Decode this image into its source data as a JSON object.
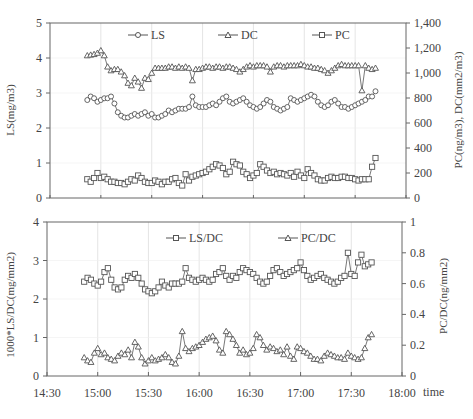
{
  "chart_data": [
    {
      "type": "line",
      "title": "",
      "x_unit": "minutes after 14:30",
      "x_range": [
        0,
        210
      ],
      "xlabel": "",
      "ylabel": "LS(mg/m3)",
      "ylabel_right": "PC(ng/m3), DC(mm2/m3)",
      "ylim": [
        0,
        5
      ],
      "ylim_right": [
        0,
        1400
      ],
      "yticks": [
        "0",
        "1",
        "2",
        "3",
        "4",
        "5"
      ],
      "yticks_right": [
        "0",
        "200",
        "400",
        "600",
        "800",
        "1,000",
        "1,200",
        "1,400"
      ],
      "grid": true,
      "legend": [
        "LS",
        "DC",
        "PC"
      ],
      "legend_position": "top inside",
      "x": [
        22,
        24,
        26,
        28,
        30,
        32,
        34,
        36,
        38,
        40,
        42,
        44,
        46,
        48,
        50,
        52,
        54,
        56,
        58,
        60,
        62,
        64,
        66,
        68,
        70,
        72,
        74,
        76,
        78,
        80,
        82,
        84,
        86,
        88,
        90,
        92,
        94,
        96,
        98,
        100,
        102,
        104,
        106,
        108,
        110,
        112,
        114,
        116,
        118,
        120,
        122,
        124,
        126,
        128,
        130,
        132,
        134,
        136,
        138,
        140,
        142,
        144,
        146,
        148,
        150,
        152,
        154,
        156,
        158,
        160,
        162,
        164,
        166,
        168,
        170,
        172,
        174,
        176,
        178,
        180,
        182,
        184,
        186,
        188,
        190,
        192
      ],
      "series": [
        {
          "name": "LS",
          "axis": "left",
          "marker": "circle",
          "values": [
            2.8,
            2.9,
            2.85,
            2.75,
            2.8,
            2.85,
            2.85,
            2.9,
            2.7,
            2.45,
            2.35,
            2.3,
            2.3,
            2.35,
            2.4,
            2.35,
            2.4,
            2.45,
            2.35,
            2.4,
            2.3,
            2.3,
            2.35,
            2.4,
            2.5,
            2.45,
            2.5,
            2.55,
            2.55,
            2.55,
            2.6,
            2.9,
            2.65,
            2.6,
            2.6,
            2.6,
            2.65,
            2.7,
            2.65,
            2.75,
            2.85,
            2.9,
            2.75,
            2.7,
            2.75,
            2.8,
            2.85,
            2.75,
            2.65,
            2.6,
            2.55,
            2.6,
            2.7,
            2.8,
            2.75,
            2.6,
            2.55,
            2.5,
            2.55,
            2.6,
            2.85,
            2.8,
            2.75,
            2.8,
            2.85,
            2.9,
            2.95,
            2.9,
            2.75,
            2.65,
            2.6,
            2.65,
            2.75,
            2.8,
            2.7,
            2.6,
            2.6,
            2.55,
            2.6,
            2.65,
            2.7,
            2.75,
            2.8,
            2.9,
            2.9,
            3.05
          ]
        },
        {
          "name": "DC",
          "axis": "right",
          "marker": "triangle",
          "values": [
            1140,
            1145,
            1150,
            1160,
            1180,
            1140,
            1050,
            1020,
            1030,
            1030,
            1010,
            980,
            920,
            900,
            960,
            930,
            880,
            960,
            950,
            1000,
            1040,
            1040,
            1040,
            1040,
            1050,
            1050,
            1040,
            1050,
            1040,
            1050,
            1040,
            940,
            1030,
            1030,
            1040,
            1050,
            1050,
            1040,
            1050,
            1050,
            1040,
            1050,
            1050,
            1040,
            1030,
            1010,
            1030,
            1050,
            1060,
            1050,
            1060,
            1060,
            1060,
            1050,
            1010,
            1050,
            1060,
            1060,
            1050,
            1060,
            1060,
            1060,
            1060,
            1070,
            1060,
            1050,
            1050,
            1040,
            1040,
            1030,
            1020,
            1000,
            1020,
            1040,
            1060,
            1070,
            1060,
            1060,
            1060,
            1060,
            1060,
            860,
            1060,
            1040,
            1030,
            1040
          ]
        },
        {
          "name": "PC",
          "axis": "right",
          "marker": "square",
          "values": [
            150,
            130,
            160,
            200,
            160,
            170,
            150,
            130,
            130,
            120,
            120,
            110,
            130,
            150,
            140,
            180,
            160,
            130,
            120,
            120,
            140,
            130,
            110,
            130,
            130,
            150,
            160,
            120,
            100,
            190,
            140,
            170,
            180,
            190,
            200,
            210,
            230,
            250,
            270,
            260,
            240,
            190,
            210,
            290,
            270,
            260,
            210,
            190,
            160,
            180,
            200,
            270,
            250,
            220,
            200,
            210,
            190,
            200,
            190,
            180,
            200,
            170,
            210,
            180,
            160,
            230,
            200,
            180,
            150,
            140,
            140,
            160,
            170,
            160,
            160,
            170,
            170,
            160,
            160,
            150,
            140,
            150,
            150,
            150,
            250,
            320
          ]
        }
      ]
    },
    {
      "type": "line",
      "title": "",
      "x_unit": "minutes after 14:30",
      "x_range": [
        0,
        210
      ],
      "xlabel": "time",
      "xticks": [
        "14:30",
        "15:00",
        "15:30",
        "16:00",
        "16:30",
        "17:00",
        "17:30",
        "18:00"
      ],
      "ylabel": "1000*LS/DC(mg/mm2)",
      "ylabel_right": "PC/DC(ng/mm2)",
      "ylim": [
        0,
        4
      ],
      "ylim_right": [
        0,
        1
      ],
      "yticks": [
        "0",
        "1",
        "2",
        "3",
        "4"
      ],
      "yticks_right": [
        "0",
        "0.2",
        "0.4",
        "0.6",
        "0.8",
        "1"
      ],
      "grid": true,
      "legend": [
        "LS/DC",
        "PC/DC"
      ],
      "legend_position": "top inside",
      "x": [
        22,
        24,
        26,
        28,
        30,
        32,
        34,
        36,
        38,
        40,
        42,
        44,
        46,
        48,
        50,
        52,
        54,
        56,
        58,
        60,
        62,
        64,
        66,
        68,
        70,
        72,
        74,
        76,
        78,
        80,
        82,
        84,
        86,
        88,
        90,
        92,
        94,
        96,
        98,
        100,
        102,
        104,
        106,
        108,
        110,
        112,
        114,
        116,
        118,
        120,
        122,
        124,
        126,
        128,
        130,
        132,
        134,
        136,
        138,
        140,
        142,
        144,
        146,
        148,
        150,
        152,
        154,
        156,
        158,
        160,
        162,
        164,
        166,
        168,
        170,
        172,
        174,
        176,
        178,
        180,
        182,
        184,
        186,
        188,
        190,
        192
      ],
      "series": [
        {
          "name": "LS/DC",
          "axis": "left",
          "marker": "square",
          "values": [
            2.45,
            2.55,
            2.5,
            2.4,
            2.35,
            2.45,
            2.7,
            2.8,
            2.5,
            2.3,
            2.25,
            2.3,
            2.5,
            2.6,
            2.55,
            2.65,
            2.55,
            2.4,
            2.25,
            2.2,
            2.15,
            2.2,
            2.3,
            2.45,
            2.35,
            2.3,
            2.4,
            2.4,
            2.4,
            2.45,
            2.8,
            2.55,
            2.5,
            2.45,
            2.5,
            2.55,
            2.5,
            2.45,
            2.5,
            2.65,
            2.7,
            2.8,
            2.6,
            2.5,
            2.6,
            2.55,
            2.7,
            2.8,
            2.75,
            2.7,
            2.65,
            2.55,
            2.45,
            2.4,
            2.45,
            2.6,
            2.75,
            2.8,
            2.7,
            2.6,
            2.65,
            2.7,
            2.75,
            2.8,
            2.95,
            2.75,
            2.6,
            2.5,
            2.55,
            2.6,
            2.65,
            2.55,
            2.5,
            2.45,
            2.4,
            2.45,
            2.55,
            2.6,
            3.2,
            2.65,
            2.6,
            2.95,
            3.15,
            2.85,
            2.9,
            2.95
          ]
        },
        {
          "name": "PC/DC",
          "axis": "right",
          "marker": "triangle",
          "values": [
            0.12,
            0.1,
            0.09,
            0.15,
            0.18,
            0.14,
            0.15,
            0.12,
            0.11,
            0.1,
            0.13,
            0.15,
            0.14,
            0.17,
            0.12,
            0.22,
            0.19,
            0.12,
            0.08,
            0.1,
            0.12,
            0.1,
            0.11,
            0.12,
            0.14,
            0.12,
            0.09,
            0.08,
            0.13,
            0.29,
            0.18,
            0.16,
            0.18,
            0.19,
            0.2,
            0.22,
            0.24,
            0.25,
            0.26,
            0.23,
            0.17,
            0.15,
            0.29,
            0.27,
            0.24,
            0.2,
            0.15,
            0.17,
            0.14,
            0.15,
            0.18,
            0.27,
            0.25,
            0.2,
            0.17,
            0.19,
            0.18,
            0.16,
            0.17,
            0.14,
            0.19,
            0.13,
            0.11,
            0.19,
            0.18,
            0.16,
            0.15,
            0.13,
            0.11,
            0.11,
            0.1,
            0.13,
            0.15,
            0.14,
            0.13,
            0.12,
            0.12,
            0.11,
            0.15,
            0.13,
            0.12,
            0.11,
            0.12,
            0.18,
            0.25,
            0.27
          ]
        }
      ]
    }
  ],
  "top_chart": {
    "ylabel_left": "LS(mg/m3)",
    "ylabel_right": "PC(ng/m3), DC(mm2/m3)",
    "left_ticks": [
      "0",
      "1",
      "2",
      "3",
      "4",
      "5"
    ],
    "right_ticks": [
      "0",
      "200",
      "400",
      "600",
      "800",
      "1,000",
      "1,200",
      "1,400"
    ],
    "legend": {
      "ls": "LS",
      "dc": "DC",
      "pc": "PC"
    }
  },
  "bottom_chart": {
    "ylabel_left": "1000*LS/DC(mg/mm2)",
    "ylabel_right": "PC/DC(ng/mm2)",
    "left_ticks": [
      "0",
      "1",
      "2",
      "3",
      "4"
    ],
    "right_ticks": [
      "0",
      "0.2",
      "0.4",
      "0.6",
      "0.8",
      "1"
    ],
    "x_ticks": [
      "14:30",
      "15:00",
      "15:30",
      "16:00",
      "16:30",
      "17:00",
      "17:30",
      "18:00"
    ],
    "xlabel": "time",
    "legend": {
      "lsdc": "LS/DC",
      "pcdc": "PC/DC"
    }
  },
  "colors": {
    "axis": "#666666",
    "grid": "#dddddd",
    "series": "#555555",
    "marker_fill": "#ffffff",
    "text": "#444444"
  }
}
